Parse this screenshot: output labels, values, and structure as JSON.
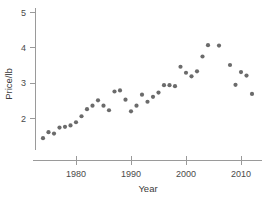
{
  "chart_data": {
    "type": "scatter",
    "title": "",
    "xlabel": "Year",
    "ylabel": "Price/lb",
    "xlim": [
      1973,
      2013
    ],
    "ylim": [
      1.2,
      5.15
    ],
    "xticks": [
      1980,
      1990,
      2000,
      2010
    ],
    "xtick_labels": [
      "1980",
      "1990",
      "2000",
      "2010"
    ],
    "yticks": [
      2,
      3,
      4,
      5
    ],
    "ytick_labels": [
      "2",
      "3",
      "4",
      "5"
    ],
    "grid": false,
    "legend": null,
    "marker_color": "#6b6b6b",
    "axis_color": "#9a9a9a",
    "points": [
      {
        "x": 1974,
        "y": 1.43
      },
      {
        "x": 1975,
        "y": 1.6
      },
      {
        "x": 1976,
        "y": 1.56
      },
      {
        "x": 1977,
        "y": 1.73
      },
      {
        "x": 1978,
        "y": 1.75
      },
      {
        "x": 1979,
        "y": 1.79
      },
      {
        "x": 1980,
        "y": 1.88
      },
      {
        "x": 1981,
        "y": 2.05
      },
      {
        "x": 1982,
        "y": 2.25
      },
      {
        "x": 1983,
        "y": 2.35
      },
      {
        "x": 1984,
        "y": 2.5
      },
      {
        "x": 1985,
        "y": 2.35
      },
      {
        "x": 1986,
        "y": 2.22
      },
      {
        "x": 1987,
        "y": 2.75
      },
      {
        "x": 1988,
        "y": 2.78
      },
      {
        "x": 1989,
        "y": 2.52
      },
      {
        "x": 1990,
        "y": 2.19
      },
      {
        "x": 1991,
        "y": 2.35
      },
      {
        "x": 1992,
        "y": 2.66
      },
      {
        "x": 1993,
        "y": 2.46
      },
      {
        "x": 1994,
        "y": 2.6
      },
      {
        "x": 1995,
        "y": 2.72
      },
      {
        "x": 1996,
        "y": 2.93
      },
      {
        "x": 1997,
        "y": 2.93
      },
      {
        "x": 1998,
        "y": 2.9
      },
      {
        "x": 1999,
        "y": 3.45
      },
      {
        "x": 2000,
        "y": 3.28
      },
      {
        "x": 2001,
        "y": 3.18
      },
      {
        "x": 2002,
        "y": 3.32
      },
      {
        "x": 2003,
        "y": 3.74
      },
      {
        "x": 2004,
        "y": 4.06
      },
      {
        "x": 2006,
        "y": 4.05
      },
      {
        "x": 2008,
        "y": 3.5
      },
      {
        "x": 2009,
        "y": 2.94
      },
      {
        "x": 2010,
        "y": 3.3
      },
      {
        "x": 2011,
        "y": 3.2
      },
      {
        "x": 2012,
        "y": 2.68
      }
    ]
  }
}
